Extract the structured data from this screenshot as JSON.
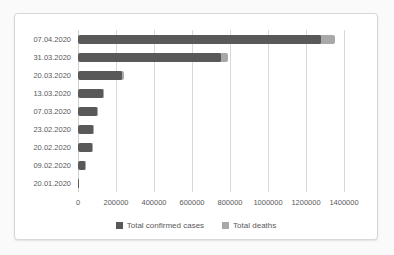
{
  "accent_colors": {
    "confirmed_cases": "#595959",
    "deaths": "#a8a8a8",
    "gridline": "#d9d9d9",
    "axis_text": "#595959",
    "frame_border": "#d8d8d8",
    "chart_background": "#ffffff"
  },
  "legend": {
    "items": [
      {
        "label": "Total confirmed cases",
        "swatch": "square-swatch",
        "color": "#595959"
      },
      {
        "label": "Total deaths",
        "swatch": "square-swatch",
        "color": "#a8a8a8"
      }
    ]
  },
  "chart_data": {
    "type": "bar",
    "orientation": "horizontal",
    "stacked": true,
    "title": "",
    "xlabel": "",
    "ylabel": "",
    "categories": [
      "07.04.2020",
      "31.03.2020",
      "20.03.2020",
      "13.03.2020",
      "07.03.2020",
      "23.02.2020",
      "20.02.2020",
      "09.02.2020",
      "20.01.2020"
    ],
    "series": [
      {
        "name": "Total confirmed cases",
        "color": "#595959",
        "values": [
          1279722,
          750890,
          234073,
          132758,
          101927,
          78811,
          75748,
          37558,
          282
        ]
      },
      {
        "name": "Total deaths",
        "color": "#a8a8a8",
        "values": [
          72614,
          36405,
          9840,
          4955,
          3486,
          2462,
          2129,
          813,
          6
        ]
      }
    ],
    "xlim": [
      0,
      1400000
    ],
    "x_ticks": [
      0,
      200000,
      400000,
      600000,
      800000,
      1000000,
      1200000,
      1400000
    ],
    "x_tick_labels": [
      "0",
      "200000",
      "400000",
      "600000",
      "800000",
      "1000000",
      "1200000",
      "1400000"
    ],
    "grid": "vertical",
    "legend_position": "bottom"
  }
}
